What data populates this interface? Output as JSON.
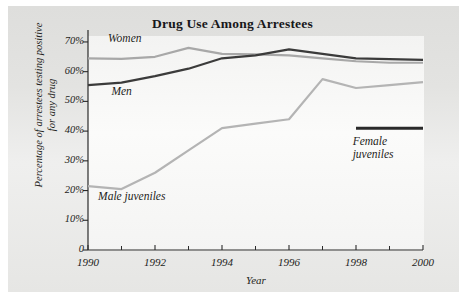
{
  "chart_data": {
    "type": "line",
    "title": "Drug Use Among Arrestees",
    "xlabel": "Year",
    "ylabel_line1": "Percentage of arrestees testing positive",
    "ylabel_line2": "for any drug",
    "x": [
      1990,
      1991,
      1992,
      1993,
      1994,
      1995,
      1996,
      1997,
      1998,
      1999,
      2000
    ],
    "xlim": [
      1990,
      2000
    ],
    "ylim": [
      0,
      72
    ],
    "grid": false,
    "legend_position": "inline-annotations",
    "xtick_labels": [
      "1990",
      "1992",
      "1994",
      "1996",
      "1998",
      "2000"
    ],
    "xtick_values": [
      1990,
      1992,
      1994,
      1996,
      1998,
      2000
    ],
    "xtick_minor_values": [
      1991,
      1993,
      1995,
      1997,
      1999
    ],
    "ytick_labels": [
      "0",
      "10%",
      "20%",
      "30%",
      "40%",
      "50%",
      "60%",
      "70%"
    ],
    "ytick_values": [
      0,
      10,
      20,
      30,
      40,
      50,
      60,
      70
    ],
    "series": [
      {
        "name": "Women",
        "color": "#a8a8a8",
        "label_x": 1990.6,
        "label_y": 71.0,
        "values": [
          64.5,
          64.3,
          65.0,
          68.0,
          66.0,
          65.8,
          65.5,
          64.5,
          63.5,
          63.0,
          63.0
        ]
      },
      {
        "name": "Men",
        "color": "#3b3b3b",
        "label_x": 1990.7,
        "label_y": 53.0,
        "values": [
          55.5,
          56.3,
          58.5,
          61.0,
          64.5,
          65.5,
          67.5,
          66.0,
          64.5,
          64.2,
          64.0
        ]
      },
      {
        "name": "Male juveniles",
        "color": "#b4b4b4",
        "label_x": 1990.3,
        "label_y": 18.0,
        "values": [
          21.5,
          20.5,
          26.0,
          33.5,
          41.0,
          42.5,
          44.0,
          57.5,
          54.5,
          55.5,
          56.5
        ]
      },
      {
        "name": "Female juveniles",
        "color": "#2a2a2a",
        "label_x": 1997.9,
        "label_y": 36.5,
        "label_line1": "Female",
        "label_line2": "juveniles",
        "x": [
          1998,
          2000
        ],
        "values": [
          41.0,
          41.0
        ]
      }
    ]
  }
}
